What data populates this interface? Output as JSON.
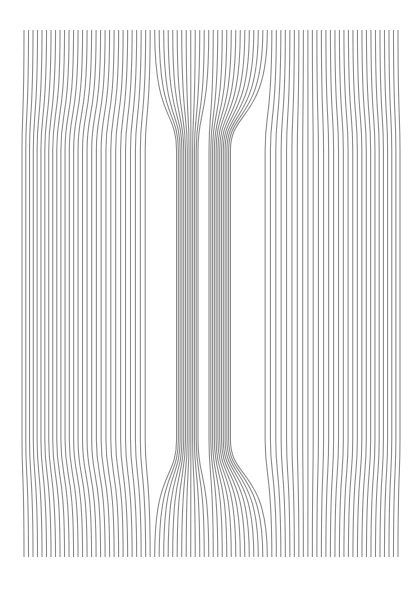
{
  "artwork": {
    "description": "Op-art line field: vertical lines pinched into two dark central bands",
    "canvas": {
      "width": 419,
      "height": 589,
      "background": "#ffffff"
    },
    "line_color": "#8a8a8a",
    "line_width": 1.1,
    "line_count": 84,
    "top_y": 30,
    "bottom_y": 557,
    "left_x": 24,
    "right_x": 398,
    "waist_top_y": 150,
    "waist_bottom_y": 440,
    "center_x": 205,
    "band_left_x": 185,
    "band_right_x": 222,
    "band_half_width": 9,
    "outer_left_x": 22,
    "outer_right_x": 400
  }
}
